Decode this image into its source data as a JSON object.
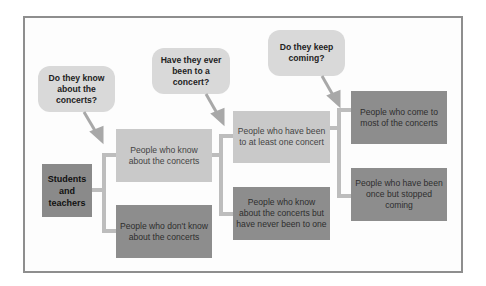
{
  "diagram": {
    "root": "Students and teachers",
    "questions": [
      "Do they know about the concerts?",
      "Have they ever been to a concert?",
      "Do they keep coming?"
    ],
    "level1": {
      "yes": "People who know about the concerts",
      "no": "People who don't know about the concerts"
    },
    "level2": {
      "yes": "People who have been to at least one concert",
      "no": "People who know about the concerts but have never been to one"
    },
    "level3": {
      "yes": "People who come to most of the concerts",
      "no": "People who have been once but stopped coming"
    },
    "colors": {
      "light_box": "#c9c9c9",
      "dark_box": "#8d8d8d",
      "bubble": "#d9d9d9",
      "connector": "#bdbdbd",
      "frame": "#8e8e8e"
    }
  }
}
